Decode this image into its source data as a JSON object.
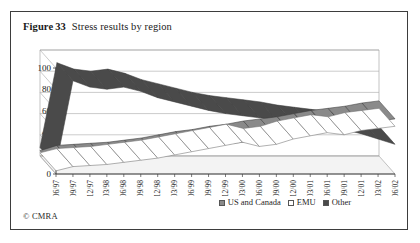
{
  "figure": {
    "label": "Figure",
    "number": "33",
    "title": "Stress results by region",
    "credit": "© CMRA"
  },
  "legend": {
    "position": "bottom-right",
    "entries": [
      {
        "label": "US and Canada",
        "swatch_name": "legend-swatch-us-and-canada",
        "color": "#8a8a8a"
      },
      {
        "label": "EMU",
        "swatch_name": "legend-swatch-emu",
        "color": "#ffffff"
      },
      {
        "label": "Other",
        "swatch_name": "legend-swatch-other",
        "color": "#4a4a4a"
      }
    ]
  },
  "chart_data": {
    "type": "line",
    "title": "Stress results by region",
    "xlabel": "",
    "ylabel": "",
    "ylim": [
      0,
      100
    ],
    "yticks": [
      0,
      20,
      40,
      60,
      80,
      100
    ],
    "grid": true,
    "three_d": true,
    "legend_position": "bottom-right",
    "x": [
      "06/97",
      "09/97",
      "12/97",
      "03/98",
      "06/98",
      "09/98",
      "12/98",
      "03/99",
      "06/99",
      "09/99",
      "12/99",
      "03/00",
      "06/00",
      "09/00",
      "12/00",
      "03/01",
      "06/01",
      "09/01",
      "12/01",
      "03/02",
      "06/02"
    ],
    "series": [
      {
        "name": "US and Canada",
        "color": "#8a8a8a",
        "values": [
          5,
          10,
          11,
          12,
          13,
          15,
          17,
          20,
          23,
          25,
          28,
          30,
          33,
          35,
          37,
          40,
          43,
          45,
          47,
          50,
          52
        ]
      },
      {
        "name": "EMU",
        "color": "#ffffff",
        "values": [
          3,
          7,
          8,
          9,
          11,
          13,
          15,
          18,
          21,
          24,
          27,
          30,
          26,
          28,
          33,
          36,
          39,
          37,
          41,
          43,
          45
        ]
      },
      {
        "name": "Other",
        "color": "#4a4a4a",
        "values": [
          8,
          88,
          82,
          80,
          82,
          78,
          72,
          68,
          64,
          60,
          57,
          55,
          53,
          51,
          48,
          46,
          44,
          42,
          38,
          33,
          28
        ]
      }
    ]
  }
}
